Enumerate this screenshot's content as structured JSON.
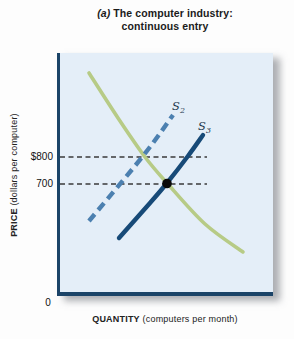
{
  "title_block": {
    "prefix": "(a)",
    "line1_rest": " The computer industry:",
    "line2": "continuous entry"
  },
  "axis_labels": {
    "y_bold": "PRICE",
    "y_rest": " (dollars per computer)",
    "x_bold": "QUANTITY",
    "x_rest": " (computers per month)"
  },
  "colors": {
    "plot_background": "#e4eef8",
    "axis": "#1b4468",
    "demand_curve": "#b7cb86",
    "s2_curve": "#4c80b0",
    "s3_curve": "#174a78",
    "reference_line": "#3a3a3a",
    "equilibrium_dot": "#0a0a0a"
  },
  "chart_data": {
    "type": "line",
    "title": "(a) The computer industry: continuous entry",
    "xlabel": "QUANTITY (computers per month)",
    "ylabel": "PRICE (dollars per computer)",
    "y_tick_labels": [
      "$800",
      "700"
    ],
    "x_tick_labels": [
      "0"
    ],
    "price_levels": [
      800,
      700
    ],
    "grid": false,
    "legend": false,
    "series": [
      {
        "name": "Demand",
        "style": "solid",
        "color": "#b7cb86",
        "width": 3.6,
        "points_px": [
          [
            89,
            73
          ],
          [
            118,
            118
          ],
          [
            145,
            157
          ],
          [
            167,
            183
          ],
          [
            205,
            224
          ],
          [
            243,
            252
          ]
        ]
      },
      {
        "name": "S2",
        "label_base": "S",
        "label_sub": "2",
        "style": "dashed",
        "color": "#4c80b0",
        "width": 4.4,
        "points_px": [
          [
            89,
            221
          ],
          [
            143,
            156
          ],
          [
            173,
            115
          ]
        ]
      },
      {
        "name": "S3",
        "label_base": "S",
        "label_sub": "3",
        "style": "solid",
        "color": "#174a78",
        "width": 4.4,
        "points_px": [
          [
            119,
            238
          ],
          [
            150,
            203
          ],
          [
            167,
            183
          ],
          [
            188,
            156
          ],
          [
            203,
            135
          ]
        ]
      }
    ],
    "reference_lines": [
      {
        "label": "$800",
        "y_px": 157,
        "x1_px": 60,
        "x2_px": 207
      },
      {
        "label": "700",
        "y_px": 184,
        "x1_px": 60,
        "x2_px": 207
      }
    ],
    "equilibrium_point_px": [
      167,
      183.5
    ]
  }
}
